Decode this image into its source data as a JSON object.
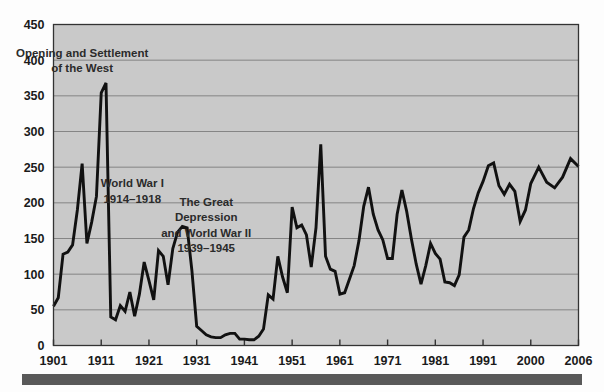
{
  "figure": {
    "background_color": "#fdfdfd",
    "plot_background_color": "#c9c9c9",
    "line_color": "#111111",
    "grid_color": "#7d7d7d",
    "axis_color": "#333333",
    "bottom_bar_color": "#595959"
  },
  "annotations": [
    {
      "id": "opening-west",
      "lines": [
        "Opening and Settlement",
        "of the West"
      ],
      "x": 1907,
      "y": 405
    },
    {
      "id": "world-war-one",
      "lines": [
        "World War I",
        "1914–1918"
      ],
      "x": 1917.5,
      "y": 222
    },
    {
      "id": "great-depression-wwii",
      "lines": [
        "The Great",
        "Depression",
        "and World War II",
        "1939–1945"
      ],
      "x": 1933,
      "y": 196
    }
  ],
  "chart_data": {
    "type": "line",
    "title": "",
    "xlabel": "",
    "ylabel": "",
    "xlim": [
      1901,
      2006
    ],
    "ylim": [
      0,
      450
    ],
    "yticks": [
      0,
      50,
      100,
      150,
      200,
      250,
      300,
      350,
      400,
      450
    ],
    "xticks": [
      1901,
      1911,
      1921,
      1931,
      1941,
      1951,
      1961,
      1971,
      1981,
      1991,
      2000,
      2006
    ],
    "xtick_labels": [
      "1901",
      "1911",
      "1921",
      "1931",
      "1941",
      "1951",
      "1961",
      "1971",
      "1981",
      "1991",
      "2000",
      "2006"
    ],
    "grid": "horizontal",
    "legend": "none",
    "series": [
      {
        "name": "Immigration",
        "x": [
          1901,
          1902,
          1903,
          1904,
          1905,
          1906,
          1907,
          1908,
          1909,
          1910,
          1911,
          1912,
          1913,
          1914,
          1915,
          1916,
          1917,
          1918,
          1919,
          1920,
          1921,
          1922,
          1923,
          1924,
          1925,
          1926,
          1927,
          1928,
          1929,
          1930,
          1931,
          1932,
          1933,
          1934,
          1935,
          1936,
          1937,
          1938,
          1939,
          1940,
          1941,
          1942,
          1943,
          1944,
          1945,
          1946,
          1947,
          1948,
          1949,
          1950,
          1951,
          1952,
          1953,
          1954,
          1955,
          1956,
          1957,
          1958,
          1959,
          1960,
          1961,
          1962,
          1963,
          1964,
          1965,
          1966,
          1967,
          1968,
          1969,
          1970,
          1971,
          1972,
          1973,
          1974,
          1975,
          1976,
          1977,
          1978,
          1979,
          1980,
          1981,
          1982,
          1983,
          1984,
          1985,
          1986,
          1987,
          1988,
          1989,
          1990,
          1991,
          1992,
          1993,
          1994,
          1995,
          1996,
          1997,
          1998,
          1999,
          2000,
          2001,
          2002,
          2003,
          2004,
          2005,
          2006
        ],
        "values": [
          55,
          67,
          128,
          131,
          141,
          190,
          255,
          143,
          173,
          209,
          354,
          368,
          40,
          36,
          56,
          48,
          75,
          41,
          72,
          117,
          91,
          64,
          133,
          125,
          85,
          136,
          159,
          167,
          165,
          105,
          27,
          21,
          15,
          12,
          11,
          11,
          15,
          17,
          17,
          9,
          9,
          8,
          8,
          13,
          23,
          71,
          65,
          125,
          96,
          74,
          194,
          165,
          169,
          155,
          110,
          165,
          282,
          125,
          107,
          104,
          72,
          74,
          93,
          112,
          147,
          195,
          222,
          184,
          162,
          148,
          122,
          122,
          184,
          218,
          188,
          149,
          114,
          86,
          112,
          143,
          129,
          121,
          89,
          88,
          84,
          99,
          152,
          162,
          192,
          214,
          230,
          252,
          256,
          224,
          212,
          226,
          216,
          174,
          190,
          227,
          250,
          229,
          221,
          236,
          262,
          251
        ]
      }
    ]
  }
}
